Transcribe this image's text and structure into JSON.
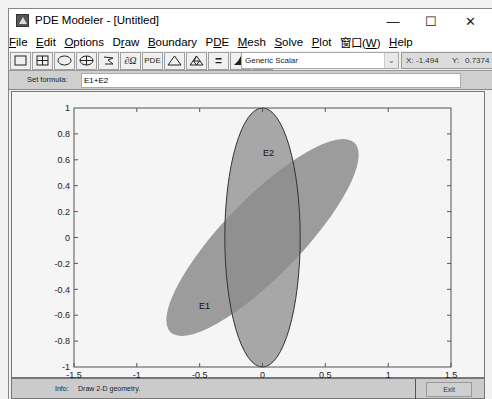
{
  "window": {
    "title": "PDE Modeler - [Untitled]",
    "controls": {
      "minimize": "—",
      "maximize": "☐",
      "close": "✕"
    }
  },
  "menubar": {
    "items": [
      {
        "label": "File",
        "mnemonic": "F"
      },
      {
        "label": "Edit",
        "mnemonic": "E"
      },
      {
        "label": "Options",
        "mnemonic": "O"
      },
      {
        "label": "Draw",
        "mnemonic": "r"
      },
      {
        "label": "Boundary",
        "mnemonic": "B"
      },
      {
        "label": "PDE",
        "mnemonic": "D"
      },
      {
        "label": "Mesh",
        "mnemonic": "M"
      },
      {
        "label": "Solve",
        "mnemonic": "S"
      },
      {
        "label": "Plot",
        "mnemonic": "P"
      },
      {
        "label": "窗口(W)",
        "mnemonic": "W"
      },
      {
        "label": "Help",
        "mnemonic": "H"
      }
    ]
  },
  "toolbar": {
    "buttons": [
      {
        "name": "rectangle-icon",
        "label": ""
      },
      {
        "name": "rectangle-center-icon",
        "label": ""
      },
      {
        "name": "ellipse-icon",
        "label": ""
      },
      {
        "name": "ellipse-center-icon",
        "label": ""
      },
      {
        "name": "polygon-icon",
        "label": ""
      },
      {
        "name": "boundary-mode-icon",
        "label": "∂Ω"
      },
      {
        "name": "pde-spec-icon",
        "label": "PDE"
      },
      {
        "name": "init-mesh-icon",
        "label": ""
      },
      {
        "name": "refine-mesh-icon",
        "label": ""
      },
      {
        "name": "solve-icon",
        "label": "="
      },
      {
        "name": "plot-solution-icon",
        "label": ""
      },
      {
        "name": "zoom-icon",
        "label": ""
      }
    ],
    "application_select": "Generic Scalar",
    "coords": {
      "x_label": "X:",
      "x_value": "-1.494",
      "y_label": "Y:",
      "y_value": "0.7374"
    }
  },
  "formula": {
    "label": "Set formula:",
    "value": "E1+E2"
  },
  "plot": {
    "shapes": [
      {
        "label": "E1",
        "type": "ellipse",
        "center": [
          0,
          0
        ],
        "semi_axes": [
          1.05,
          0.3
        ],
        "rotation_deg": 45
      },
      {
        "label": "E2",
        "type": "ellipse",
        "center": [
          0,
          0
        ],
        "semi_axes": [
          0.3,
          1.0
        ],
        "rotation_deg": 0
      }
    ],
    "x_ticks": [
      "-1.5",
      "-1",
      "-0.5",
      "0",
      "0.5",
      "1",
      "1.5"
    ],
    "y_ticks": [
      "1",
      "0.8",
      "0.6",
      "0.4",
      "0.2",
      "0",
      "-0.2",
      "-0.4",
      "-0.6",
      "-0.8",
      "-1"
    ],
    "xlim": [
      -1.5,
      1.5
    ],
    "ylim": [
      -1,
      1
    ],
    "colors": {
      "fill": "#8c8c8c",
      "edge": "#333333",
      "axis": "#555555"
    }
  },
  "status": {
    "label": "Info:",
    "text": "Draw 2-D geometry.",
    "exit_label": "Exit"
  }
}
